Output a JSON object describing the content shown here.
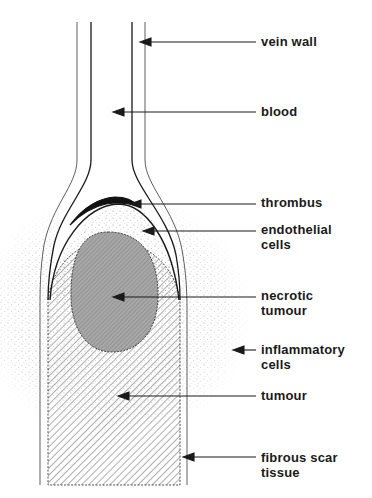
{
  "figure": {
    "colors": {
      "line": "#1a1a1a",
      "necrotic_fill": "#a8a8a8",
      "stipple": "#9a9a9a",
      "background": "#ffffff"
    }
  },
  "labels": [
    {
      "id": "vein-wall",
      "text": "vein wall",
      "x": 261,
      "y": 34,
      "arrow_tip": [
        140,
        42
      ]
    },
    {
      "id": "blood",
      "text": "blood",
      "x": 261,
      "y": 104,
      "arrow_tip": [
        113,
        112
      ]
    },
    {
      "id": "thrombus",
      "text": "thrombus",
      "x": 261,
      "y": 195,
      "arrow_tip": [
        130,
        204
      ]
    },
    {
      "id": "endothelial-cells",
      "text": "endothelial\ncells",
      "x": 261,
      "y": 222,
      "arrow_tip": [
        143,
        231
      ]
    },
    {
      "id": "necrotic-tumour",
      "text": "necrotic\ntumour",
      "x": 261,
      "y": 288,
      "arrow_tip": [
        113,
        297
      ]
    },
    {
      "id": "inflammatory-cells",
      "text": "inflammatory\ncells",
      "x": 261,
      "y": 342,
      "arrow_tip": [
        233,
        350
      ]
    },
    {
      "id": "tumour",
      "text": "tumour",
      "x": 261,
      "y": 388,
      "arrow_tip": [
        118,
        396
      ]
    },
    {
      "id": "fibrous-scar-tissue",
      "text": "fibrous scar\ntissue",
      "x": 261,
      "y": 450,
      "arrow_tip": [
        183,
        457
      ]
    }
  ]
}
